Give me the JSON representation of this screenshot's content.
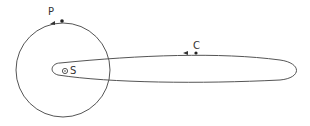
{
  "labels": {
    "planet": "P",
    "sun": "S",
    "comet": "C"
  },
  "elements": {
    "planet_orbit": "circular orbit",
    "comet_orbit": "highly elongated elliptical orbit",
    "sun_symbol": "circle-dot",
    "direction": "counterclockwise (arrows pointing left at top)"
  },
  "colors": {
    "stroke": "#555555",
    "background": "#ffffff"
  }
}
